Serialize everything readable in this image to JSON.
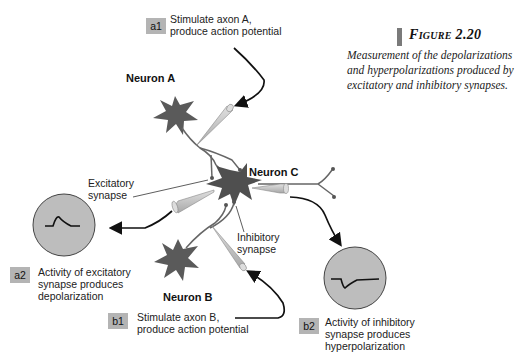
{
  "figure": {
    "title": "Figure 2.20",
    "caption": "Measurement of the depolarizations and hyperpolarizations produced by excitatory and inhibitory synapses."
  },
  "steps": {
    "a1": {
      "tag": "a1",
      "line1": "Stimulate axon A,",
      "line2": "produce action potential"
    },
    "a2": {
      "tag": "a2",
      "line1": "Activity of excitatory",
      "line2": "synapse produces",
      "line3": "depolarization"
    },
    "b1": {
      "tag": "b1",
      "line1": "Stimulate axon B,",
      "line2": "produce action potential"
    },
    "b2": {
      "tag": "b2",
      "line1": "Activity of inhibitory",
      "line2": "synapse produces",
      "line3": "hyperpolarization"
    }
  },
  "neurons": {
    "a": "Neuron A",
    "b": "Neuron B",
    "c": "Neuron C"
  },
  "synapses": {
    "excitatory_line1": "Excitatory",
    "excitatory_line2": "synapse",
    "inhibitory_line1": "Inhibitory",
    "inhibitory_line2": "synapse"
  },
  "colors": {
    "neuron": "#5a5a5a",
    "electrode": "#c8c8c8",
    "scope": "#bdbdbd",
    "tag": "#b4b4b4",
    "arrow": "#111111"
  }
}
